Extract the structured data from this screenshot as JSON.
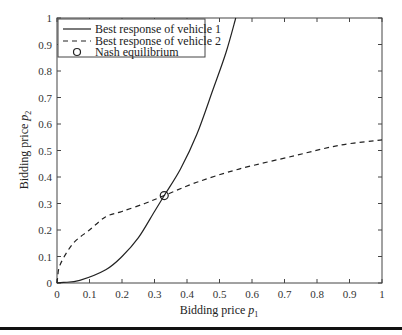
{
  "chart_data": {
    "type": "line",
    "title": "",
    "xlabel": "Bidding price p1",
    "ylabel": "Bidding price p2",
    "xlabel_parts": {
      "text": "Bidding price ",
      "var": "p",
      "sub": "1"
    },
    "ylabel_parts": {
      "text": "Bidding price ",
      "var": "p",
      "sub": "2"
    },
    "xlim": [
      0,
      1
    ],
    "ylim": [
      0,
      1
    ],
    "xticks": [
      "0",
      "0.1",
      "0.2",
      "0.3",
      "0.4",
      "0.5",
      "0.6",
      "0.7",
      "0.8",
      "0.9",
      "1"
    ],
    "yticks": [
      "0",
      "0.1",
      "0.2",
      "0.3",
      "0.4",
      "0.5",
      "0.6",
      "0.7",
      "0.8",
      "0.9",
      "1"
    ],
    "grid": false,
    "legend_position": "upper left",
    "series": [
      {
        "name": "Best response of vehicle 1",
        "style": "solid",
        "x": [
          0,
          0.02,
          0.07,
          0.15,
          0.2,
          0.25,
          0.3,
          0.33,
          0.38,
          0.43,
          0.48,
          0.52,
          0.55
        ],
        "y": [
          0,
          0.002,
          0.01,
          0.05,
          0.1,
          0.17,
          0.27,
          0.33,
          0.43,
          0.56,
          0.73,
          0.87,
          1.0
        ]
      },
      {
        "name": "Best response of vehicle 2",
        "style": "dashed",
        "x": [
          0,
          0.002,
          0.01,
          0.05,
          0.1,
          0.15,
          0.2,
          0.27,
          0.33,
          0.43,
          0.56,
          0.73,
          0.87,
          1.0
        ],
        "y": [
          0,
          0.02,
          0.07,
          0.15,
          0.2,
          0.25,
          0.27,
          0.3,
          0.33,
          0.38,
          0.43,
          0.48,
          0.52,
          0.54
        ]
      },
      {
        "name": "Nash equilibrium",
        "style": "marker-circle",
        "x": [
          0.33
        ],
        "y": [
          0.33
        ]
      }
    ]
  },
  "legend": {
    "items": [
      {
        "label": "Best response of vehicle 1"
      },
      {
        "label": "Best response of vehicle 2"
      },
      {
        "label": "Nash equilibrium"
      }
    ]
  }
}
